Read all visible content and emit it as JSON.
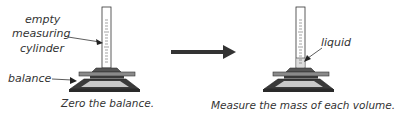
{
  "diagram": {
    "left_panel": {
      "labels": {
        "cylinder_line1": "empty",
        "cylinder_line2": "measuring",
        "cylinder_line3": "cylinder",
        "balance": "balance"
      },
      "caption": "Zero the balance."
    },
    "right_panel": {
      "labels": {
        "liquid": "liquid"
      },
      "caption": "Measure the mass of each volume."
    },
    "colors": {
      "outline": "#333333",
      "cylinder_fill": "#ffffff",
      "collar": "#555555",
      "pan": "#8a8a8a",
      "base_dark": "#3a3a3a",
      "base_light": "#c8c8c8",
      "arrow": "#333333",
      "liquid": "#dddddd"
    }
  }
}
